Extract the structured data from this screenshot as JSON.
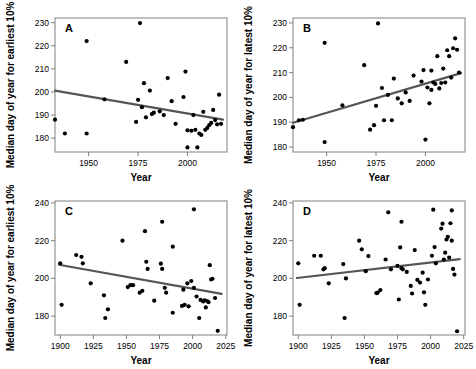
{
  "figure": {
    "type": "multi-panel-scatter",
    "panels": 4,
    "layout": "2x2"
  },
  "chart_data": [
    {
      "type": "scatter",
      "panel_label": "A",
      "title": "",
      "xlabel": "Year",
      "ylabel": "Median day of year for earliest 10%",
      "xlim": [
        1933,
        2020
      ],
      "ylim": [
        174,
        232
      ],
      "xticks": [
        1950,
        1975,
        2000
      ],
      "yticks": [
        180,
        190,
        200,
        210,
        220,
        230
      ],
      "grid": false,
      "legend": "none",
      "trendline": {
        "x": [
          1933,
          2018
        ],
        "y": [
          200.6,
          188.0
        ],
        "direction": "decreasing"
      },
      "points": [
        [
          1933,
          188.0
        ],
        [
          1938,
          182.0
        ],
        [
          1949,
          222.0
        ],
        [
          1949,
          182.0
        ],
        [
          1958,
          196.8
        ],
        [
          1969,
          213.0
        ],
        [
          1974,
          187.0
        ],
        [
          1975,
          196.6
        ],
        [
          1976,
          229.8
        ],
        [
          1977,
          193.4
        ],
        [
          1978,
          203.8
        ],
        [
          1979,
          189.0
        ],
        [
          1981,
          200.6
        ],
        [
          1982,
          190.4
        ],
        [
          1983,
          191.0
        ],
        [
          1986,
          191.6
        ],
        [
          1988,
          190.0
        ],
        [
          1990,
          206.0
        ],
        [
          1992,
          196.0
        ],
        [
          1994,
          186.2
        ],
        [
          1998,
          197.8
        ],
        [
          1999,
          208.8
        ],
        [
          2000,
          183.4
        ],
        [
          2000,
          176.0
        ],
        [
          2002,
          183.2
        ],
        [
          2003,
          190.0
        ],
        [
          2004,
          183.6
        ],
        [
          2005,
          176.0
        ],
        [
          2006,
          182.0
        ],
        [
          2007,
          181.4
        ],
        [
          2008,
          191.4
        ],
        [
          2009,
          183.6
        ],
        [
          2010,
          184.4
        ],
        [
          2011,
          185.6
        ],
        [
          2012,
          186.6
        ],
        [
          2013,
          192.2
        ],
        [
          2014,
          187.8
        ],
        [
          2015,
          186.0
        ],
        [
          2016,
          198.8
        ],
        [
          2017,
          186.2
        ]
      ]
    },
    {
      "type": "scatter",
      "panel_label": "B",
      "title": "",
      "xlabel": "Year",
      "ylabel": "Median day of year for latest 10%",
      "xlim": [
        1933,
        2020
      ],
      "ylim": [
        178,
        232
      ],
      "xticks": [
        1950,
        1975,
        2000
      ],
      "yticks": [
        180,
        190,
        200,
        210,
        220,
        230
      ],
      "grid": false,
      "legend": "none",
      "trendline": {
        "x": [
          1933,
          2018
        ],
        "y": [
          189.8,
          209.8
        ],
        "direction": "increasing"
      },
      "points": [
        [
          1933,
          188.0
        ],
        [
          1936,
          190.8
        ],
        [
          1938,
          191.0
        ],
        [
          1949,
          222.0
        ],
        [
          1949,
          182.0
        ],
        [
          1958,
          196.8
        ],
        [
          1969,
          213.0
        ],
        [
          1972,
          187.0
        ],
        [
          1974,
          188.8
        ],
        [
          1975,
          196.6
        ],
        [
          1976,
          229.8
        ],
        [
          1978,
          203.8
        ],
        [
          1979,
          190.8
        ],
        [
          1981,
          201.0
        ],
        [
          1983,
          190.8
        ],
        [
          1984,
          207.6
        ],
        [
          1986,
          199.6
        ],
        [
          1988,
          197.6
        ],
        [
          1990,
          202.0
        ],
        [
          1992,
          198.6
        ],
        [
          1994,
          208.8
        ],
        [
          1998,
          206.4
        ],
        [
          1999,
          211.0
        ],
        [
          2000,
          183.0
        ],
        [
          2001,
          204.0
        ],
        [
          2002,
          197.6
        ],
        [
          2003,
          210.8
        ],
        [
          2003,
          203.0
        ],
        [
          2004,
          206.0
        ],
        [
          2005,
          205.4
        ],
        [
          2006,
          216.6
        ],
        [
          2007,
          203.6
        ],
        [
          2008,
          205.8
        ],
        [
          2009,
          211.6
        ],
        [
          2010,
          206.0
        ],
        [
          2011,
          219.0
        ],
        [
          2012,
          216.6
        ],
        [
          2013,
          208.0
        ],
        [
          2014,
          219.8
        ],
        [
          2015,
          223.8
        ],
        [
          2016,
          219.2
        ],
        [
          2017,
          210.0
        ]
      ]
    },
    {
      "type": "scatter",
      "panel_label": "C",
      "title": "",
      "xlabel": "Year",
      "ylabel": "Median day of year for earliest 10%",
      "xlim": [
        1896,
        2026
      ],
      "ylim": [
        170,
        241
      ],
      "xticks": [
        1900,
        1925,
        1950,
        1975,
        2000,
        2025
      ],
      "yticks": [
        180,
        200,
        220,
        240
      ],
      "grid": false,
      "legend": "none",
      "trendline": {
        "x": [
          1899,
          2022
        ],
        "y": [
          207.2,
          191.8
        ],
        "direction": "decreasing"
      },
      "points": [
        [
          1900,
          208.0
        ],
        [
          1901,
          186.0
        ],
        [
          1912,
          212.4
        ],
        [
          1916,
          211.4
        ],
        [
          1917,
          208.0
        ],
        [
          1923,
          197.4
        ],
        [
          1933,
          191.0
        ],
        [
          1934,
          179.0
        ],
        [
          1936,
          183.6
        ],
        [
          1947,
          220.0
        ],
        [
          1951,
          195.4
        ],
        [
          1953,
          196.4
        ],
        [
          1955,
          196.4
        ],
        [
          1960,
          192.4
        ],
        [
          1962,
          193.4
        ],
        [
          1964,
          225.0
        ],
        [
          1965,
          208.8
        ],
        [
          1966,
          205.0
        ],
        [
          1971,
          188.2
        ],
        [
          1976,
          207.8
        ],
        [
          1977,
          230.0
        ],
        [
          1977,
          205.0
        ],
        [
          1979,
          195.0
        ],
        [
          1980,
          192.4
        ],
        [
          1985,
          216.8
        ],
        [
          1985,
          181.8
        ],
        [
          1992,
          185.4
        ],
        [
          1993,
          194.0
        ],
        [
          1994,
          186.0
        ],
        [
          1996,
          197.4
        ],
        [
          1997,
          185.2
        ],
        [
          1999,
          198.6
        ],
        [
          2001,
          236.6
        ],
        [
          2001,
          195.0
        ],
        [
          2003,
          190.4
        ],
        [
          2005,
          179.0
        ],
        [
          2006,
          188.6
        ],
        [
          2008,
          187.8
        ],
        [
          2009,
          188.4
        ],
        [
          2010,
          184.6
        ],
        [
          2011,
          188.0
        ],
        [
          2012,
          187.4
        ],
        [
          2013,
          207.0
        ],
        [
          2014,
          199.4
        ],
        [
          2015,
          199.8
        ],
        [
          2017,
          189.6
        ],
        [
          2019,
          172.2
        ]
      ]
    },
    {
      "type": "scatter",
      "panel_label": "D",
      "title": "",
      "xlabel": "Year",
      "ylabel": "Median day of year for latest 10%",
      "xlim": [
        1896,
        2026
      ],
      "ylim": [
        170,
        241
      ],
      "xticks": [
        1900,
        1925,
        1950,
        1975,
        2000,
        2025
      ],
      "yticks": [
        180,
        200,
        220,
        240
      ],
      "grid": false,
      "legend": "none",
      "trendline": {
        "x": [
          1899,
          2022
        ],
        "y": [
          200.2,
          210.2
        ],
        "direction": "increasing"
      },
      "points": [
        [
          1900,
          208.0
        ],
        [
          1901,
          186.0
        ],
        [
          1912,
          212.0
        ],
        [
          1917,
          212.0
        ],
        [
          1919,
          204.8
        ],
        [
          1920,
          205.4
        ],
        [
          1923,
          197.4
        ],
        [
          1934,
          207.6
        ],
        [
          1935,
          179.0
        ],
        [
          1936,
          200.0
        ],
        [
          1946,
          220.0
        ],
        [
          1948,
          215.4
        ],
        [
          1951,
          203.8
        ],
        [
          1953,
          211.8
        ],
        [
          1959,
          192.2
        ],
        [
          1960,
          192.4
        ],
        [
          1962,
          193.8
        ],
        [
          1966,
          210.0
        ],
        [
          1968,
          235.0
        ],
        [
          1970,
          204.8
        ],
        [
          1975,
          206.6
        ],
        [
          1976,
          188.8
        ],
        [
          1977,
          216.4
        ],
        [
          1978,
          230.0
        ],
        [
          1978,
          205.4
        ],
        [
          1979,
          204.8
        ],
        [
          1982,
          203.4
        ],
        [
          1985,
          196.0
        ],
        [
          1986,
          192.0
        ],
        [
          1988,
          215.0
        ],
        [
          1990,
          199.2
        ],
        [
          1992,
          197.8
        ],
        [
          1994,
          203.0
        ],
        [
          1995,
          192.6
        ],
        [
          1996,
          186.0
        ],
        [
          1998,
          199.4
        ],
        [
          2001,
          212.0
        ],
        [
          2002,
          236.4
        ],
        [
          2003,
          216.6
        ],
        [
          2004,
          208.0
        ],
        [
          2008,
          226.4
        ],
        [
          2009,
          229.0
        ],
        [
          2010,
          210.0
        ],
        [
          2011,
          213.6
        ],
        [
          2012,
          220.6
        ],
        [
          2013,
          222.0
        ],
        [
          2014,
          211.0
        ],
        [
          2015,
          229.2
        ],
        [
          2016,
          236.0
        ],
        [
          2016,
          220.0
        ],
        [
          2017,
          205.0
        ],
        [
          2018,
          202.0
        ],
        [
          2020,
          172.0
        ]
      ]
    }
  ]
}
